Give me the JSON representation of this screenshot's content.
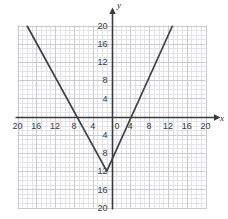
{
  "chart_data": {
    "type": "line",
    "title": "",
    "subtitle": "",
    "xlabel": "x",
    "ylabel": "y",
    "xlim": [
      -20,
      20
    ],
    "ylim": [
      -20,
      20
    ],
    "grid": true,
    "minor_grid_step": 1,
    "major_grid_step": 4,
    "legend": "none",
    "xticks": [
      -20,
      -16,
      -12,
      -8,
      -4,
      0,
      4,
      8,
      12,
      16,
      20
    ],
    "yticks": [
      -20,
      -16,
      -12,
      -8,
      -4,
      0,
      4,
      8,
      12,
      16,
      20
    ],
    "xtick_labels": [
      "20",
      "16",
      "12",
      "8",
      "4",
      "0",
      "4",
      "8",
      "12",
      "16",
      "20"
    ],
    "ytick_labels": [
      "20",
      "16",
      "12",
      "8",
      "4",
      "0",
      "4",
      "8",
      "12",
      "16",
      "20"
    ],
    "series": [
      {
        "name": "absolute-value-graph",
        "shape": "v",
        "color": "#404040",
        "vertex": [
          -1,
          -12
        ],
        "x_intercepts": [
          -7,
          3
        ],
        "left_branch": [
          [
            -18,
            20
          ],
          [
            -1,
            -12
          ]
        ],
        "right_branch": [
          [
            -1,
            -12
          ],
          [
            13,
            20
          ]
        ],
        "x": [
          -18,
          -1,
          13
        ],
        "values": [
          20,
          -12,
          20
        ]
      }
    ],
    "axis_color": "#3a3a3a",
    "grid_color_minor": "#e2e2e8",
    "grid_color_major": "#c9c9d2",
    "background": "#ffffff"
  },
  "labels": {
    "x_axis_name": "x",
    "y_axis_name": "y",
    "origin_label": "0"
  }
}
